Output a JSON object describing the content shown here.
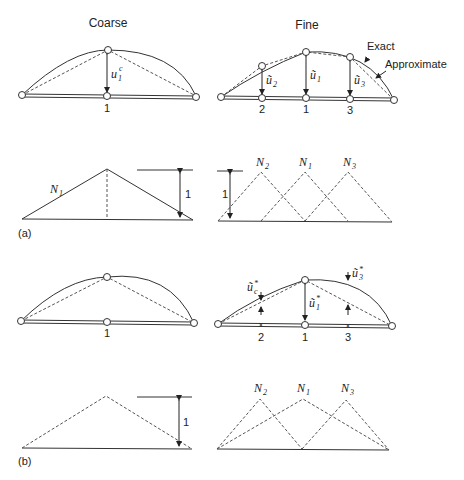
{
  "headers": {
    "coarse": "Coarse",
    "fine": "Fine"
  },
  "panel_labels": {
    "a": "(a)",
    "b": "(b)"
  },
  "legend": {
    "exact": "Exact",
    "approximate": "Approximate"
  },
  "node_labels": {
    "n1": "1",
    "n2": "2",
    "n3": "3"
  },
  "unit_label": "1",
  "displacements_a": {
    "coarse_base": "u",
    "coarse_sup": "c",
    "coarse_sub": "1",
    "fine_u1": "ũ",
    "fine_u1_sub": "1",
    "fine_u2": "ũ",
    "fine_u2_sub": "2",
    "fine_u3": "ũ",
    "fine_u3_sub": "3"
  },
  "displacements_b": {
    "u1": "ũ",
    "u1_sub": "1",
    "u1_sup": "*",
    "u2": "ũ",
    "u2_sub": "c",
    "u2_sup": "*",
    "u3": "ũ",
    "u3_sub": "3",
    "u3_sup": "*"
  },
  "shape_functions": {
    "N": "N",
    "n1_sub": "1",
    "n2_sub": "2",
    "n3_sub": "3"
  },
  "colors": {
    "line": "#333333",
    "dash": "#555555",
    "background": "#ffffff"
  }
}
